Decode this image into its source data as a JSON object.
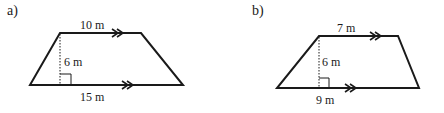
{
  "figures": [
    {
      "part_label": "a)",
      "shape": "trapezoid",
      "top_label": "10 m",
      "height_label": "6 m",
      "bottom_label": "15 m"
    },
    {
      "part_label": "b)",
      "shape": "trapezoid",
      "top_label": "7 m",
      "height_label": "6 m",
      "bottom_label": "9 m"
    }
  ],
  "icons": {
    "parallel_marker": "double-chevron-arrow",
    "right_angle": "right-angle-square"
  },
  "colors": {
    "line": "#1a1a1a",
    "background": "#ffffff"
  }
}
